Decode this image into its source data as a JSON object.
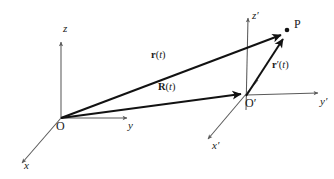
{
  "figure": {
    "background_color": "#ffffff",
    "axis_color": "#5a5a5a",
    "vector_color": "#121212",
    "label_color": "#1a1a1a"
  },
  "frames": [
    {
      "name": "fixed-frame",
      "origin_label": "O",
      "origin_point": [
        61,
        118
      ],
      "axes": [
        {
          "name": "z-axis",
          "label": "z",
          "from": [
            61,
            118
          ],
          "to": [
            61,
            42
          ]
        },
        {
          "name": "y-axis",
          "label": "y",
          "from": [
            61,
            118
          ],
          "to": [
            127,
            118
          ]
        },
        {
          "name": "x-axis",
          "label": "x",
          "from": [
            61,
            118
          ],
          "to": [
            22,
            163
          ]
        }
      ]
    },
    {
      "name": "moving-frame",
      "origin_label": "O′",
      "origin_point": [
        246,
        95
      ],
      "axes": [
        {
          "name": "z-prime-axis",
          "label": "z′",
          "from": [
            246,
            95
          ],
          "to": [
            248,
            18
          ]
        },
        {
          "name": "y-prime-axis",
          "label": "y′",
          "from": [
            246,
            95
          ],
          "to": [
            318,
            93
          ]
        },
        {
          "name": "x-prime-axis",
          "label": "x′",
          "from": [
            246,
            95
          ],
          "to": [
            208,
            139
          ]
        }
      ]
    }
  ],
  "points": [
    {
      "name": "point-P",
      "label": "P",
      "position": [
        285,
        32
      ]
    }
  ],
  "vectors": [
    {
      "name": "vector-r",
      "label_parts": {
        "symbol": "r",
        "arg_open": "(",
        "arg": "t",
        "arg_close": ")"
      },
      "label_plain": "r(t)",
      "from": [
        61,
        118
      ],
      "to": [
        283,
        34
      ],
      "description": "position of P in the fixed frame"
    },
    {
      "name": "vector-R",
      "label_parts": {
        "symbol": "R",
        "arg_open": "(",
        "arg": "t",
        "arg_close": ")"
      },
      "label_plain": "R(t)",
      "from": [
        61,
        118
      ],
      "to": [
        243,
        94
      ],
      "description": "position of the moving origin O' in the fixed frame"
    },
    {
      "name": "vector-r-prime",
      "label_parts": {
        "symbol": "r",
        "prime": "′",
        "arg_open": "(",
        "arg": "t",
        "arg_close": ")"
      },
      "label_plain": "r′(t)",
      "from": [
        246,
        95
      ],
      "to": [
        284,
        38
      ],
      "description": "position of P in the moving frame"
    }
  ],
  "axis_labels": {
    "z": "z",
    "y": "y",
    "x": "x",
    "z_prime": "z′",
    "y_prime": "y′",
    "x_prime": "x′"
  },
  "origin_labels": {
    "O": "O",
    "O_prime": "O′"
  },
  "point_labels": {
    "P": "P"
  },
  "vector_label_text": {
    "r_symbol": "r",
    "R_symbol": "R",
    "r_prime_symbol": "r",
    "prime_mark": "′",
    "arg_open": "(",
    "arg_t": "t",
    "arg_close": ")"
  }
}
